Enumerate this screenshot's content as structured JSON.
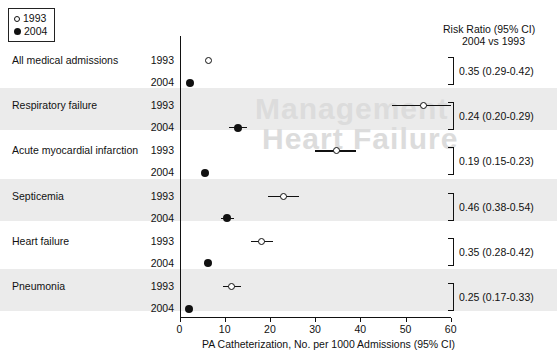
{
  "legend": {
    "items": [
      {
        "marker": "open-circle",
        "label": "1993"
      },
      {
        "marker": "filled-circle",
        "label": "2004"
      }
    ]
  },
  "header": {
    "rr_line1": "Risk Ratio (95% CI)",
    "rr_line2": "2004 vs 1993"
  },
  "axis": {
    "title": "PA Catheterization, No. per 1000 Admissions (95% CI)",
    "ticks": [
      "0",
      "10",
      "20",
      "30",
      "40",
      "50",
      "60"
    ]
  },
  "watermark": {
    "line1": "Management",
    "line2": "Heart Failure"
  },
  "chart_data": {
    "type": "scatter",
    "title": "",
    "xlabel": "PA Catheterization, No. per 1000 Admissions (95% CI)",
    "ylabel": "",
    "xlim": [
      0,
      60
    ],
    "xticks": [
      0,
      10,
      20,
      30,
      40,
      50,
      60
    ],
    "grid": false,
    "legend_position": "top-left",
    "series": [
      {
        "name": "1993",
        "marker": "open-circle"
      },
      {
        "name": "2004",
        "marker": "filled-circle"
      }
    ],
    "categories": [
      "All medical admissions",
      "Respiratory failure",
      "Acute myocardial infarction",
      "Septicemia",
      "Heart failure",
      "Pneumonia"
    ],
    "rows": [
      {
        "label": "All medical admissions",
        "shaded": false,
        "points": [
          {
            "year": "1993",
            "value": 6.5,
            "ci_low": 6.2,
            "ci_high": 6.8
          },
          {
            "year": "2004",
            "value": 2.3,
            "ci_low": 2.1,
            "ci_high": 2.5
          }
        ],
        "risk_ratio": "0.35 (0.29-0.42)"
      },
      {
        "label": "Respiratory failure",
        "shaded": true,
        "points": [
          {
            "year": "1993",
            "value": 54.0,
            "ci_low": 47.0,
            "ci_high": 60.0
          },
          {
            "year": "2004",
            "value": 13.0,
            "ci_low": 11.0,
            "ci_high": 15.0
          }
        ],
        "risk_ratio": "0.24 (0.20-0.29)"
      },
      {
        "label": "Acute myocardial infarction",
        "shaded": false,
        "points": [
          {
            "year": "1993",
            "value": 34.7,
            "ci_low": 30.0,
            "ci_high": 39.0
          },
          {
            "year": "2004",
            "value": 5.6,
            "ci_low": 4.9,
            "ci_high": 6.3
          }
        ],
        "risk_ratio": "0.19 (0.15-0.23)"
      },
      {
        "label": "Septicemia",
        "shaded": true,
        "points": [
          {
            "year": "1993",
            "value": 23.0,
            "ci_low": 19.5,
            "ci_high": 26.5
          },
          {
            "year": "2004",
            "value": 10.6,
            "ci_low": 9.2,
            "ci_high": 12.0
          }
        ],
        "risk_ratio": "0.46 (0.38-0.54)"
      },
      {
        "label": "Heart failure",
        "shaded": false,
        "points": [
          {
            "year": "1993",
            "value": 18.2,
            "ci_low": 15.8,
            "ci_high": 20.6
          },
          {
            "year": "2004",
            "value": 6.2,
            "ci_low": 5.4,
            "ci_high": 7.0
          }
        ],
        "risk_ratio": "0.35 (0.28-0.42)"
      },
      {
        "label": "Pneumonia",
        "shaded": true,
        "points": [
          {
            "year": "1993",
            "value": 11.6,
            "ci_low": 9.6,
            "ci_high": 13.6
          },
          {
            "year": "2004",
            "value": 2.1,
            "ci_low": 1.7,
            "ci_high": 2.6
          }
        ],
        "risk_ratio": "0.25 (0.17-0.33)"
      }
    ]
  }
}
